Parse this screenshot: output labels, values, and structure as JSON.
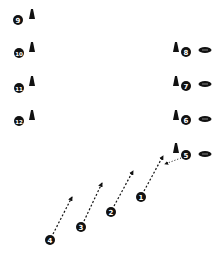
{
  "diagram": {
    "colors": {
      "ink": "#111111",
      "background": "#ffffff"
    },
    "cones": [
      {
        "id": "cone-9",
        "x": 32,
        "y": 14
      },
      {
        "id": "cone-10",
        "x": 32,
        "y": 47
      },
      {
        "id": "cone-11",
        "x": 32,
        "y": 81
      },
      {
        "id": "cone-12",
        "x": 32,
        "y": 115
      },
      {
        "id": "cone-8",
        "x": 176,
        "y": 47
      },
      {
        "id": "cone-7",
        "x": 176,
        "y": 81
      },
      {
        "id": "cone-6",
        "x": 176,
        "y": 115
      },
      {
        "id": "cone-5",
        "x": 176,
        "y": 148
      }
    ],
    "players": [
      {
        "label": "9",
        "x": 18,
        "y": 20
      },
      {
        "label": "10",
        "x": 19,
        "y": 53
      },
      {
        "label": "11",
        "x": 19,
        "y": 88
      },
      {
        "label": "12",
        "x": 19,
        "y": 121
      },
      {
        "label": "8",
        "x": 186,
        "y": 52
      },
      {
        "label": "7",
        "x": 186,
        "y": 86
      },
      {
        "label": "6",
        "x": 186,
        "y": 120
      },
      {
        "label": "5",
        "x": 186,
        "y": 155
      },
      {
        "label": "1",
        "x": 141,
        "y": 197
      },
      {
        "label": "2",
        "x": 111,
        "y": 212
      },
      {
        "label": "3",
        "x": 81,
        "y": 227
      },
      {
        "label": "4",
        "x": 50,
        "y": 240
      }
    ],
    "footballs": [
      {
        "id": "ball-8",
        "x": 205,
        "y": 50
      },
      {
        "id": "ball-7",
        "x": 205,
        "y": 84
      },
      {
        "id": "ball-6",
        "x": 205,
        "y": 119
      },
      {
        "id": "ball-5",
        "x": 205,
        "y": 154
      }
    ],
    "routes": [
      {
        "from": "1",
        "x1": 144,
        "y1": 191,
        "x2": 163,
        "y2": 156
      },
      {
        "from": "2",
        "x1": 114,
        "y1": 206,
        "x2": 133,
        "y2": 171
      },
      {
        "from": "3",
        "x1": 84,
        "y1": 221,
        "x2": 102,
        "y2": 183
      },
      {
        "from": "4",
        "x1": 53,
        "y1": 234,
        "x2": 72,
        "y2": 197
      }
    ],
    "passes": [
      {
        "from": "5",
        "x1": 181,
        "y1": 158,
        "x2": 165,
        "y2": 164
      }
    ]
  }
}
